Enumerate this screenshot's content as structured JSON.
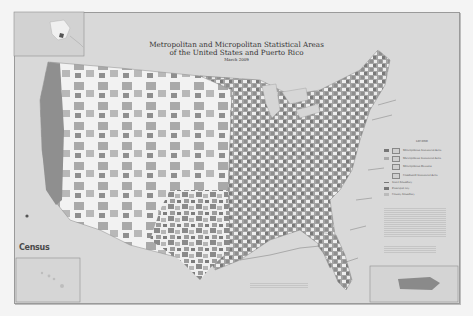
{
  "map": {
    "title_line1": "Metropolitan and Micropolitan Statistical Areas",
    "title_line2": "of the United States and Puerto Rico",
    "date": "March 2009",
    "publisher_logo": "Census",
    "insets": [
      "Alaska",
      "Hawaii",
      "Puerto Rico"
    ],
    "legend": {
      "heading": "LEGEND",
      "items": [
        {
          "symbol": "dark-fill",
          "label": "Metropolitan Statistical Area"
        },
        {
          "symbol": "light-fill",
          "label": "Micropolitan Statistical Area"
        },
        {
          "symbol": "outline",
          "label": "Metropolitan Division"
        },
        {
          "symbol": "outline-box",
          "label": "Combined Statistical Area"
        },
        {
          "symbol": "line",
          "label": "State boundary"
        },
        {
          "symbol": "text-dark",
          "label": "Principal city"
        },
        {
          "symbol": "text-light",
          "label": "County boundary"
        }
      ]
    },
    "colors": {
      "background": "#d9d9d9",
      "metro": "#8a8a8a",
      "micro": "#b5b5b5",
      "non_cbsa": "#efefef",
      "water": "#d6d6d6",
      "page": "#f4f4f4"
    }
  }
}
